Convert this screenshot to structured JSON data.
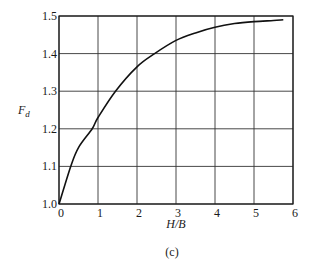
{
  "chart_data": {
    "type": "line",
    "title": "",
    "caption": "(c)",
    "xlabel": "H/B",
    "ylabel": "F",
    "ylabel_subscript": "d",
    "xlim": [
      0,
      6
    ],
    "ylim": [
      1.0,
      1.5
    ],
    "grid": true,
    "x_ticks": [
      "0",
      "1",
      "2",
      "3",
      "4",
      "5",
      "6"
    ],
    "y_ticks": [
      "1.0",
      "1.1",
      "1.2",
      "1.3",
      "1.4",
      "1.5"
    ],
    "series": [
      {
        "name": "F_d vs H/B",
        "x": [
          0,
          0.3,
          0.5,
          0.85,
          1.0,
          1.45,
          2.0,
          2.45,
          3.0,
          3.5,
          4.0,
          4.5,
          5.0,
          5.5,
          5.75
        ],
        "y": [
          1.0,
          1.1,
          1.15,
          1.2,
          1.23,
          1.3,
          1.365,
          1.4,
          1.435,
          1.455,
          1.47,
          1.48,
          1.485,
          1.488,
          1.49
        ]
      }
    ],
    "legend": null
  },
  "plot_box": {
    "left": 59,
    "top": 16,
    "right": 293,
    "bottom": 204
  }
}
